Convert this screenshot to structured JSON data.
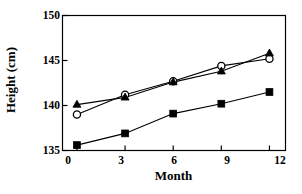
{
  "chart_data": {
    "type": "line",
    "title": "",
    "xlabel": "Month",
    "ylabel": "Height (cm)",
    "x": [
      0,
      3,
      6,
      9,
      12
    ],
    "xticklabels": [
      "0",
      "3",
      "6",
      "9",
      "12"
    ],
    "yticklabels": [
      "135",
      "140",
      "145",
      "150"
    ],
    "yticks": [
      135,
      140,
      145,
      150
    ],
    "xlim": [
      -0.9,
      13.0
    ],
    "ylim": [
      135,
      150
    ],
    "grid": false,
    "legend": "none",
    "frame": "box",
    "line_color": "#000000",
    "background": "#ffffff",
    "series": [
      {
        "name": "open-circle-series",
        "marker": "circle-open",
        "values": [
          139.0,
          141.2,
          142.7,
          144.4,
          145.2
        ]
      },
      {
        "name": "filled-triangle-series",
        "marker": "triangle-filled",
        "values": [
          140.1,
          140.9,
          142.6,
          143.8,
          145.8
        ]
      },
      {
        "name": "filled-square-series",
        "marker": "square-filled",
        "values": [
          135.6,
          136.9,
          139.1,
          140.2,
          141.5
        ]
      }
    ]
  },
  "axes": {
    "xlabel": "Month",
    "ylabel": "Height (cm)",
    "ytick_labels": [
      "150",
      "145",
      "140",
      "135"
    ],
    "xtick_labels": [
      "0",
      "3",
      "6",
      "9",
      "12"
    ]
  }
}
